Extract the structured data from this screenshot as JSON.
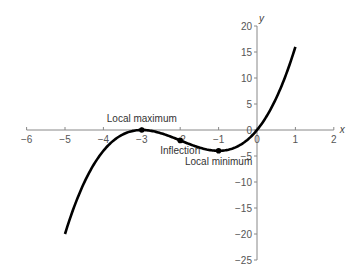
{
  "chart_data": {
    "type": "line",
    "title": "",
    "xlabel": "x",
    "ylabel": "y",
    "xlim": [
      -6,
      2
    ],
    "ylim": [
      -25,
      20
    ],
    "grid": false,
    "x_ticks": [
      -6,
      -5,
      -4,
      -3,
      -2,
      -1,
      0,
      1,
      2
    ],
    "x_tick_labels": [
      "−6",
      "−5",
      "−4",
      "−3",
      "−2",
      "−1",
      "0",
      "1",
      "2"
    ],
    "y_ticks": [
      20,
      15,
      10,
      5,
      0,
      -5,
      -10,
      -15,
      -20,
      -25
    ],
    "y_tick_labels": [
      "20",
      "15",
      "10",
      "5",
      "0",
      "−5",
      "−10",
      "−15",
      "−20",
      "−25"
    ],
    "series": [
      {
        "name": "y = x(x+3)^2",
        "x": [
          -5,
          -4.5,
          -4,
          -3.5,
          -3,
          -2.5,
          -2,
          -1.5,
          -1,
          -0.5,
          0,
          0.5,
          1
        ],
        "values": [
          -20,
          -10.125,
          -4,
          -0.875,
          0,
          -1.25,
          -2,
          -3.375,
          -4,
          -3.125,
          0,
          6.125,
          16
        ]
      }
    ],
    "annotations": [
      {
        "label": "Local maximum",
        "x": -3,
        "y": 0
      },
      {
        "label": "Inflection",
        "x": -2,
        "y": -2
      },
      {
        "label": "Local minimum",
        "x": -1,
        "y": -4
      }
    ]
  }
}
